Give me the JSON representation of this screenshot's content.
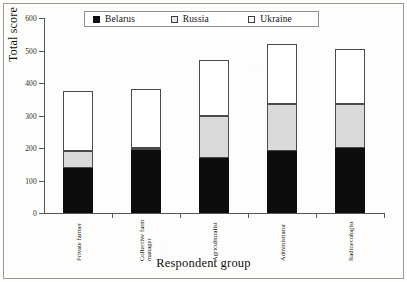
{
  "chart_data": {
    "type": "bar",
    "subtype": "stacked-bar",
    "title": "",
    "xlabel": "Respondent group",
    "ylabel": "Total score",
    "ylim": [
      0,
      600
    ],
    "yticks": [
      0,
      100,
      200,
      300,
      400,
      500,
      600
    ],
    "grid": false,
    "legend_position": "top-center",
    "categories": [
      "Private farmer",
      "Collective farm manager",
      "Agriculturalist",
      "Administrator",
      "Radioecologist"
    ],
    "category_lines": [
      [
        "Private farmer"
      ],
      [
        "Collective farm",
        "manager"
      ],
      [
        "Agriculturalist"
      ],
      [
        "Administrator"
      ],
      [
        "Radioecologist"
      ]
    ],
    "series": [
      {
        "name": "Belarus",
        "color": "#0d0d0d",
        "values": [
          140,
          195,
          170,
          190,
          200
        ]
      },
      {
        "name": "Russia",
        "color": "#d9d9d9",
        "values": [
          50,
          5,
          130,
          145,
          135
        ]
      },
      {
        "name": "Ukraine",
        "color": "#ffffff",
        "values": [
          185,
          180,
          170,
          185,
          170
        ]
      }
    ],
    "totals": [
      375,
      380,
      470,
      520,
      505
    ]
  },
  "legend": {
    "items": [
      {
        "label": "Belarus",
        "swatch": "filled-black-square-icon"
      },
      {
        "label": "Russia",
        "swatch": "light-gray-square-icon"
      },
      {
        "label": "Ukraine",
        "swatch": "white-square-icon"
      }
    ]
  }
}
